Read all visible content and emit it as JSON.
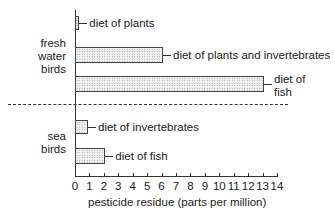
{
  "chart_data": {
    "type": "bar",
    "orientation": "horizontal",
    "title": "",
    "xlabel": "pesticide residue (parts per million)",
    "ylabel": "",
    "xlim": [
      0,
      14
    ],
    "xticks": [
      "0",
      "1",
      "2",
      "3",
      "4",
      "5",
      "6",
      "7",
      "8",
      "9",
      "10",
      "11",
      "12",
      "13",
      "14"
    ],
    "grid": false,
    "legend": null,
    "groups": [
      {
        "name": "fresh water birds",
        "label_lines": [
          "fresh",
          "water",
          "birds"
        ],
        "bars": [
          {
            "category": "diet of plants",
            "value": 0.3
          },
          {
            "category": "diet of plants and invertebrates",
            "value": 6.1
          },
          {
            "category": "diet of fish",
            "value": 13.1,
            "label_lines": [
              "diet of",
              "fish"
            ]
          }
        ]
      },
      {
        "name": "sea birds",
        "label_lines": [
          "sea",
          "birds"
        ],
        "bars": [
          {
            "category": "diet of invertebrates",
            "value": 0.9
          },
          {
            "category": "diet of fish",
            "value": 2.1
          }
        ]
      }
    ],
    "categories": [
      "diet of plants",
      "diet of plants and invertebrates",
      "diet of fish",
      "diet of invertebrates",
      "diet of fish"
    ],
    "values": [
      0.3,
      6.1,
      13.1,
      0.9,
      2.1
    ],
    "annotations": [
      "dashed line separates fresh water birds from sea birds"
    ]
  },
  "labels": {
    "fw_line1": "fresh",
    "fw_line2": "water",
    "fw_line3": "birds",
    "sea_line1": "sea",
    "sea_line2": "birds",
    "bar1": "diet of plants",
    "bar2": "diet of plants and invertebrates",
    "bar3_line1": "diet of",
    "bar3_line2": "fish",
    "bar4": "diet of invertebrates",
    "bar5": "diet of fish",
    "xlabel": "pesticide residue (parts per million)"
  }
}
